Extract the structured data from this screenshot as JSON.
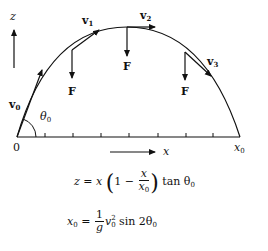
{
  "diagram": {
    "axis": {
      "vertical_label": "z",
      "horizontal_label": "x",
      "origin_label": "0",
      "end_label": "x",
      "end_label_sub": "0",
      "tick_count": 7
    },
    "initial": {
      "velocity_label": "v",
      "velocity_sub": "0",
      "angle_label": "θ",
      "angle_sub": "0"
    },
    "velocities": [
      {
        "label": "v",
        "sub": "1"
      },
      {
        "label": "v",
        "sub": "2"
      },
      {
        "label": "v",
        "sub": "3"
      }
    ],
    "forces": [
      {
        "label": "F"
      },
      {
        "label": "F"
      },
      {
        "label": "F"
      }
    ],
    "equations": {
      "trajectory": {
        "lhs": "z = x",
        "one_minus": "1 −",
        "frac_num": "x",
        "frac_den": "x",
        "frac_den_sub": "0",
        "rhs": "tan θ",
        "rhs_sub": "0"
      },
      "range": {
        "lhs": "x",
        "lhs_sub": "0",
        "eq": " = ",
        "frac_num": "1",
        "frac_den": "g",
        "v": "v",
        "v_sup": "2",
        "v_sub": "0",
        "rhs": "sin 2θ",
        "rhs_sub": "0"
      }
    },
    "colors": {
      "ink": "#111111",
      "background": "#ffffff"
    }
  }
}
